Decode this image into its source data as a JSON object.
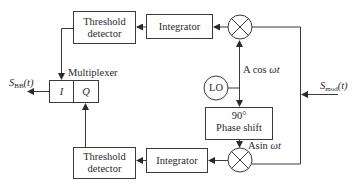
{
  "diagram": {
    "type": "block-diagram",
    "blocks": {
      "threshold_top": {
        "line1": "Threshold",
        "line2": "detector"
      },
      "integrator_top": {
        "label": "Integrator"
      },
      "threshold_bottom": {
        "line1": "Threshold",
        "line2": "detector"
      },
      "integrator_bottom": {
        "label": "Integrator"
      },
      "lo": {
        "label": "LO"
      },
      "phase_shift": {
        "line1": "90°",
        "line2": "Phase shift"
      },
      "multiplexer": {
        "label": "Multiplexer",
        "port_i": "I",
        "port_q": "Q"
      }
    },
    "signals": {
      "output_main": "S",
      "output_sub": "BB",
      "output_arg": "(t)",
      "input_main": "S",
      "input_sub": "mod",
      "input_arg": "(t)",
      "cos_label_prefix": "A cos ",
      "cos_label_var": "ωt",
      "sin_label_prefix": "Asin ",
      "sin_label_var": "ωt"
    },
    "colors": {
      "stroke": "#3a3a3a",
      "text": "#2a2a2a",
      "background": "#ffffff"
    }
  }
}
